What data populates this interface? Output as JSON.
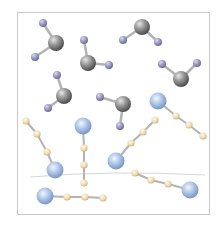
{
  "diagram": {
    "colors": {
      "frame": "#c8c8c8",
      "gray_atom": "#8a8a8a",
      "purple_atom": "#9a98c4",
      "blue_atom": "#a9c2e6",
      "tan_atom": "#f0d9a8",
      "bond": "#b0b0b0",
      "divider": "#d0d0d0"
    },
    "bent_molecules": [
      {
        "center": [
          56,
          43
        ],
        "atoms": [
          [
            43,
            23
          ],
          [
            35,
            57
          ]
        ]
      },
      {
        "center": [
          142,
          27
        ],
        "atoms": [
          [
            123,
            40
          ],
          [
            158,
            42
          ]
        ]
      },
      {
        "center": [
          88,
          63
        ],
        "atoms": [
          [
            84,
            40
          ],
          [
            109,
            65
          ]
        ]
      },
      {
        "center": [
          181,
          79
        ],
        "atoms": [
          [
            162,
            64
          ],
          [
            197,
            63
          ]
        ]
      },
      {
        "center": [
          64,
          96
        ],
        "atoms": [
          [
            57,
            75
          ],
          [
            48,
            108
          ]
        ]
      },
      {
        "center": [
          123,
          104
        ],
        "atoms": [
          [
            100,
            97
          ],
          [
            120,
            126
          ]
        ]
      }
    ],
    "chain_molecules": [
      {
        "big": [
          158,
          101
        ],
        "small": [
          [
            176,
            116
          ],
          [
            189,
            125
          ],
          [
            203,
            136
          ]
        ]
      },
      {
        "big": [
          55,
          170
        ],
        "small": [
          [
            26,
            121
          ],
          [
            37,
            134
          ],
          [
            47,
            152
          ]
        ]
      },
      {
        "big": [
          83,
          126
        ],
        "small": [
          [
            84,
            148
          ],
          [
            84,
            165
          ],
          [
            84,
            183
          ]
        ]
      },
      {
        "big": [
          116,
          161
        ],
        "small": [
          [
            131,
            143
          ],
          [
            143,
            132
          ],
          [
            155,
            120
          ]
        ]
      },
      {
        "big": [
          190,
          190
        ],
        "small": [
          [
            135,
            173
          ],
          [
            151,
            180
          ],
          [
            168,
            184
          ]
        ]
      },
      {
        "big": [
          45,
          196
        ],
        "small": [
          [
            67,
            197
          ],
          [
            85,
            197
          ],
          [
            103,
            198
          ]
        ]
      }
    ]
  }
}
